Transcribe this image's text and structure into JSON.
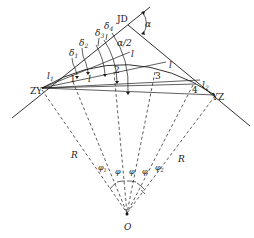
{
  "diagram": {
    "type": "circular-curve-deflection-angle-layout",
    "points": {
      "JD": "JD",
      "ZY": "ZY",
      "YZ": "YZ",
      "O": "O"
    },
    "angles": {
      "alpha": "α",
      "half_alpha": "α/2",
      "deltas": [
        "δ",
        "δ",
        "δ",
        "δ"
      ],
      "delta_subs": [
        "1",
        "2",
        "3",
        "4"
      ],
      "phis": [
        {
          "sym": "φ",
          "sub": "1"
        },
        {
          "sym": "φ",
          "sub": ""
        },
        {
          "sym": "φ",
          "sub": ""
        },
        {
          "sym": "φ",
          "sub": ""
        },
        {
          "sym": "φ",
          "sub": "2"
        }
      ]
    },
    "arc_lengths": {
      "l1": {
        "sym": "l",
        "sub": "1"
      },
      "l2": {
        "sym": "l",
        "sub": "2"
      },
      "l_chord_labels": [
        "l",
        "l",
        "l"
      ]
    },
    "stations": [
      "1",
      "2",
      "3",
      "4"
    ],
    "radius_labels": [
      "R",
      "R"
    ]
  }
}
